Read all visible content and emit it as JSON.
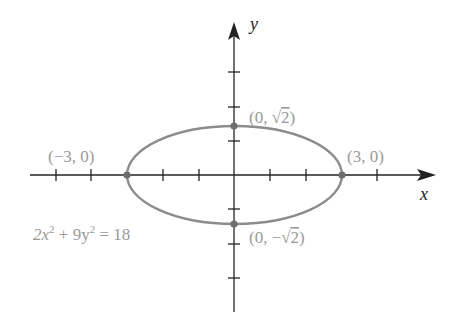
{
  "diagram": {
    "type": "ellipse-graph",
    "axes": {
      "x_label": "x",
      "y_label": "y"
    },
    "colors": {
      "axis": "#222222",
      "curve": "#8c8c8c",
      "label": "#9a9a9a",
      "point": "#7a7a7a"
    },
    "equation": {
      "lhs_a": "2x",
      "lhs_b": " + 9y",
      "rhs": " = 18",
      "exp": "2"
    },
    "points": [
      {
        "label_open": "(0, ",
        "label_val": "2",
        "label_close": ")",
        "x": 0,
        "y": 1.4142,
        "radical": true,
        "sign": ""
      },
      {
        "label": "(3, 0)",
        "x": 3,
        "y": 0
      },
      {
        "label": "(−3, 0)",
        "x": -3,
        "y": 0
      },
      {
        "label_open": "(0, −",
        "label_val": "2",
        "label_close": ")",
        "x": 0,
        "y": -1.4142,
        "radical": true
      }
    ],
    "x_ticks": [
      -5,
      -4,
      -3,
      -2,
      -1,
      1,
      2,
      3,
      4
    ],
    "y_ticks": [
      -3,
      -2,
      -1,
      1,
      2,
      3
    ]
  }
}
